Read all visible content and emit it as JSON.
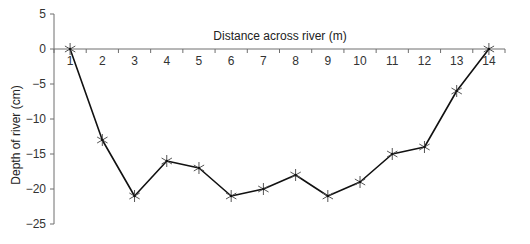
{
  "chart_data": {
    "type": "line",
    "title": "",
    "xlabel": "Distance across river (m)",
    "ylabel": "Depth of river (cm)",
    "categories": [
      "1",
      "2",
      "3",
      "4",
      "5",
      "6",
      "7",
      "8",
      "9",
      "10",
      "11",
      "12",
      "13",
      "14"
    ],
    "x": [
      1,
      2,
      3,
      4,
      5,
      6,
      7,
      8,
      9,
      10,
      11,
      12,
      13,
      14
    ],
    "series": [
      {
        "name": "River depth",
        "values": [
          0,
          -13,
          -21,
          -16,
          -17,
          -21,
          -20,
          -18,
          -21,
          -19,
          -15,
          -14,
          -6,
          0
        ],
        "marker": "asterisk",
        "color": "#111111"
      }
    ],
    "ylim": [
      -25,
      5
    ],
    "yticks": [
      5,
      0,
      -5,
      -10,
      -15,
      -20,
      -25
    ],
    "ytick_labels": [
      "5",
      "0",
      "−25",
      "−5",
      "−10",
      "−15",
      "−20",
      "−25"
    ],
    "grid": false,
    "legend": "none",
    "x_axis_position": "y=0"
  },
  "labels": {
    "xlabel": "Distance across river (m)",
    "ylabel": "Depth of river (cm)",
    "yticks": [
      "5",
      "0",
      "−5",
      "−10",
      "−15",
      "−20",
      "−25"
    ]
  },
  "colors": {
    "axis": "#6e6e6e",
    "line": "#111111",
    "marker": "#555555"
  }
}
